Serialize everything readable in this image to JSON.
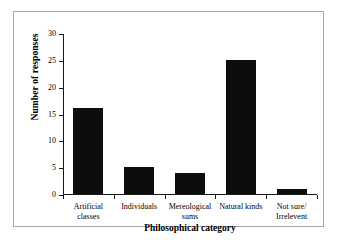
{
  "chart_data": {
    "type": "bar",
    "title": "",
    "xlabel": "Philosophical category",
    "ylabel": "Number of responses",
    "categories": [
      "Artificial classes",
      "Individuals",
      "Mereological sums",
      "Natural kinds",
      "Not sure/ Irrelevent"
    ],
    "category_lines": [
      [
        "Artificial",
        "classes"
      ],
      [
        "Individuals",
        ""
      ],
      [
        "Mereological",
        "sums"
      ],
      [
        "Natural kinds",
        ""
      ],
      [
        "Not sure/",
        "Irrelevent"
      ]
    ],
    "values": [
      16,
      5,
      4,
      25,
      1
    ],
    "ylim": [
      0,
      30
    ],
    "yticks": [
      0,
      5,
      10,
      15,
      20,
      25,
      30
    ],
    "ytick_labels": [
      "0",
      "5",
      "10",
      "15",
      "20",
      "25",
      "30"
    ],
    "grid": false,
    "legend": null,
    "bar_color": "#0d0d0d",
    "axis_color": "#1a1a1a",
    "frame_color": "#a9a9a9",
    "background": "#ffffff"
  }
}
